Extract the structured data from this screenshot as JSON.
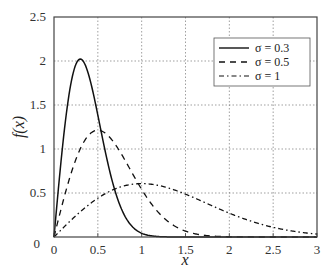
{
  "chart_data": {
    "type": "line",
    "title": "",
    "xlabel": "x",
    "ylabel": "f(x)",
    "xlim": [
      0,
      3
    ],
    "ylim": [
      0,
      2.5
    ],
    "xticks": [
      "0",
      "0.5",
      "1",
      "1.5",
      "2",
      "2.5",
      "3"
    ],
    "yticks": [
      "0",
      "0.5",
      "1",
      "1.5",
      "2",
      "2.5"
    ],
    "grid": true,
    "legend_position": "upper right",
    "series": [
      {
        "name": "σ = 0.3",
        "sigma": 0.3,
        "style": "solid",
        "x": [
          0,
          0.1,
          0.2,
          0.3,
          0.4,
          0.5,
          0.6,
          0.7,
          0.8,
          0.9,
          1.0,
          1.2
        ],
        "values": [
          0,
          1.05,
          1.78,
          2.02,
          1.83,
          1.4,
          0.9,
          0.5,
          0.25,
          0.11,
          0.04,
          0.0
        ]
      },
      {
        "name": "σ = 0.5",
        "sigma": 0.5,
        "style": "dashed",
        "x": [
          0,
          0.25,
          0.5,
          0.75,
          1.0,
          1.25,
          1.5,
          1.75,
          2.0
        ],
        "values": [
          0,
          0.88,
          1.21,
          1.95,
          0.54,
          0.22,
          0.07,
          0.02,
          0.0
        ]
      },
      {
        "name": "σ = 1",
        "sigma": 1,
        "style": "dashdot",
        "x": [
          0,
          0.5,
          1.0,
          1.5,
          2.0,
          2.5,
          3.0
        ],
        "values": [
          0,
          0.44,
          0.61,
          0.49,
          0.27,
          0.11,
          0.03
        ]
      }
    ]
  },
  "axes": {
    "xlabel": "x",
    "ylabel": "f(x)",
    "xticks": [
      "0",
      "0.5",
      "1",
      "1.5",
      "2",
      "2.5",
      "3"
    ],
    "yticks": [
      "0",
      "0.5",
      "1",
      "1.5",
      "2",
      "2.5"
    ]
  },
  "legend": {
    "items": [
      {
        "label": "σ = 0.3"
      },
      {
        "label": "σ = 0.5"
      },
      {
        "label": "σ = 1"
      }
    ]
  }
}
